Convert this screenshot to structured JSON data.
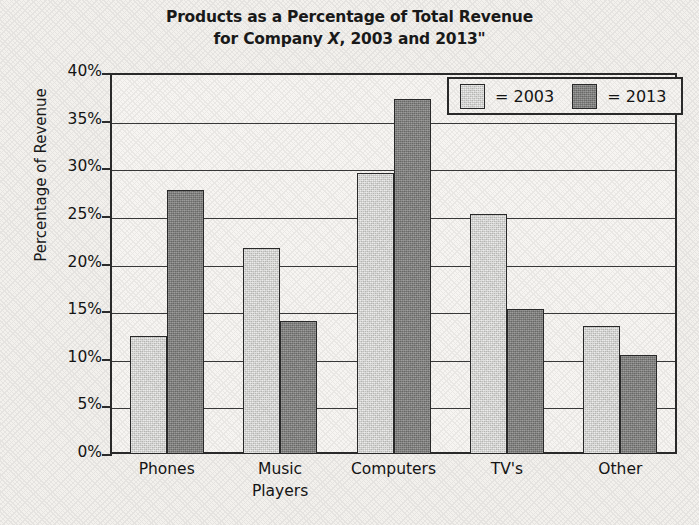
{
  "chart_data": {
    "type": "bar",
    "title": "Products as a Percentage of Total Revenue for Company X, 2003 and 2013\"",
    "title_line1": "Products as a Percentage of Total Revenue",
    "title_line2_pre": "for Company ",
    "title_line2_ital": "X",
    "title_line2_post": ", 2003 and 2013\"",
    "xlabel": "",
    "ylabel": "Percentage of Revenue",
    "ylim": [
      0,
      40
    ],
    "ytick_values": [
      0,
      5,
      10,
      15,
      20,
      25,
      30,
      35,
      40
    ],
    "ytick_labels": [
      "0%",
      "5%",
      "10%",
      "15%",
      "20%",
      "25%",
      "30%",
      "35%",
      "40%"
    ],
    "grid": true,
    "grid_axis": "y",
    "legend_position": "upper right",
    "categories": [
      "Phones",
      "Music Players",
      "Computers",
      "TV's",
      "Other"
    ],
    "category_lines": [
      [
        "Phones"
      ],
      [
        "Music",
        "Players"
      ],
      [
        "Computers"
      ],
      [
        "TV's"
      ],
      [
        "Other"
      ]
    ],
    "series": [
      {
        "name": "2003",
        "legend_label": "= 2003",
        "color": "#cbcbc8",
        "values": [
          12.4,
          21.6,
          29.5,
          25.2,
          13.4
        ]
      },
      {
        "name": "2013",
        "legend_label": "= 2013",
        "color": "#7c7c7a",
        "values": [
          27.7,
          14.0,
          37.3,
          15.2,
          10.4
        ]
      }
    ]
  },
  "colors": {
    "background": "#f3f1ed",
    "plot_background": "#f7f5f2",
    "axis": "#2b2b2b",
    "gridline": "#3a3a3a",
    "text": "#151515",
    "series_2003": "#cbcbc8",
    "series_2013": "#7c7c7a"
  }
}
